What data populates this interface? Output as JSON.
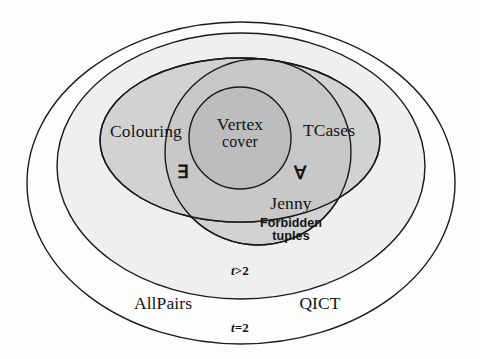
{
  "diagram": {
    "type": "euler-venn",
    "colors": {
      "outline": "#1a1a1a",
      "outer_fill": "#fdfdfd",
      "mid_fill": "#efefef",
      "inner_fill": "#d2d2d2",
      "overlap_fill": "#bfbfbf",
      "text": "#141414"
    },
    "regions": [
      {
        "id": "t-eq-2",
        "label": "t=2",
        "shape": "ellipse",
        "fill": "#fdfdfd",
        "members": [
          "AllPairs",
          "QICT"
        ]
      },
      {
        "id": "t-gt-2",
        "label": "t >2",
        "shape": "ellipse",
        "fill": "#efefef",
        "members": []
      },
      {
        "id": "colouring-tcases",
        "label": "",
        "shape": "ellipse",
        "fill": "#d2d2d2",
        "members": [
          "Colouring",
          "TCases"
        ]
      },
      {
        "id": "jenny-forbidden",
        "label": "",
        "shape": "circle",
        "fill": "#d2d2d2",
        "members": [
          "Jenny",
          "Forbidden tuples"
        ]
      },
      {
        "id": "vertex-cover",
        "label": "Vertex cover",
        "shape": "circle",
        "fill": "#bfbfbf",
        "members": [
          "Vertex cover"
        ]
      }
    ],
    "labels": {
      "colouring": "Colouring",
      "vertex_cover_line1": "Vertex",
      "vertex_cover_line2": "cover",
      "tcases": "TCases",
      "exists": "∃",
      "forall": "∀",
      "jenny": "Jenny",
      "forbidden_line1": "Forbidden",
      "forbidden_line2": "tuples",
      "t_gt_2_italic": "t",
      "t_gt_2_rest": ">2",
      "allpairs": "AllPairs",
      "qict": "QICT",
      "t_eq_2_italic": "t",
      "t_eq_2_rest": "=2"
    }
  }
}
